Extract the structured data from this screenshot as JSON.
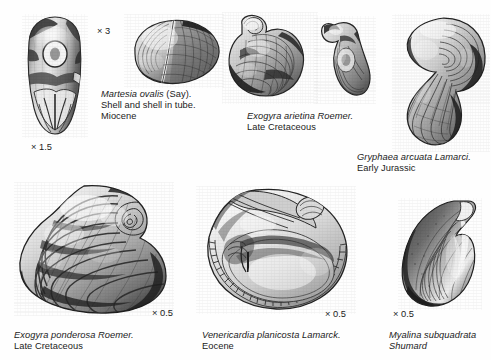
{
  "plate": {
    "title": "Fossil bivalve specimens plate",
    "background_color": "#fefefe",
    "ink_color": "#1b1b1b"
  },
  "specimens": [
    {
      "id": "martesia-tube",
      "name": "martesia-shell-in-tube",
      "magnification": "× 1.5",
      "caption_lines": []
    },
    {
      "id": "martesia-ovalis",
      "name": "martesia-ovalis",
      "magnification": "× 3",
      "caption_lines": [
        {
          "sci": "Martesia ovalis",
          "plain": " (Say)."
        },
        {
          "sci": "",
          "plain": "Shell and shell in tube."
        },
        {
          "sci": "",
          "plain": "Miocene"
        }
      ]
    },
    {
      "id": "exogyra-arietina",
      "name": "exogyra-arietina",
      "magnification": "",
      "caption_lines": [
        {
          "sci": "Exogyra arietina Roemer.",
          "plain": ""
        },
        {
          "sci": "",
          "plain": "Late Cretaceous"
        }
      ]
    },
    {
      "id": "gryphaea-arcuata",
      "name": "gryphaea-arcuata",
      "magnification": "",
      "caption_lines": [
        {
          "sci": "Gryphaea arcuata Lamarci.",
          "plain": ""
        },
        {
          "sci": "",
          "plain": "Early Jurassic"
        }
      ]
    },
    {
      "id": "exogyra-ponderosa",
      "name": "exogyra-ponderosa",
      "magnification": "× 0.5",
      "caption_lines": [
        {
          "sci": "Exogyra ponderosa Roemer.",
          "plain": ""
        },
        {
          "sci": "",
          "plain": "Late Cretaceous"
        }
      ]
    },
    {
      "id": "venericardia-planicosta",
      "name": "venericardia-planicosta",
      "magnification": "× 0.5",
      "caption_lines": [
        {
          "sci": "Venericardia planicosta Lamarck.",
          "plain": ""
        },
        {
          "sci": "",
          "plain": "Eocene"
        }
      ]
    },
    {
      "id": "myalina-subquadrata",
      "name": "myalina-subquadrata",
      "magnification": "× 0.5",
      "caption_lines": [
        {
          "sci": "Myalina subquadrata",
          "plain": ""
        },
        {
          "sci": "Shumard",
          "plain": ""
        }
      ]
    }
  ],
  "labels": {
    "mag_martesia_tube": "× 1.5",
    "mag_martesia_ovalis": "× 3",
    "mag_exogyra_ponderosa": "× 0.5",
    "mag_venericardia": "× 0.5",
    "mag_myalina": "× 0.5",
    "cap_martesia_l1_sci": "Martesia ovalis",
    "cap_martesia_l1_plain": " (Say).",
    "cap_martesia_l2": "Shell and shell in tube.",
    "cap_martesia_l3": "Miocene",
    "cap_arietina_l1": "Exogyra arietina Roemer.",
    "cap_arietina_l2": "Late Cretaceous",
    "cap_gryphaea_l1": "Gryphaea arcuata Lamarci.",
    "cap_gryphaea_l2": "Early Jurassic",
    "cap_ponderosa_l1": "Exogyra ponderosa Roemer.",
    "cap_ponderosa_l2": "Late Cretaceous",
    "cap_venericardia_l1": "Venericardia planicosta Lamarck.",
    "cap_venericardia_l2": "Eocene",
    "cap_myalina_l1": "Myalina subquadrata",
    "cap_myalina_l2": "Shumard"
  }
}
